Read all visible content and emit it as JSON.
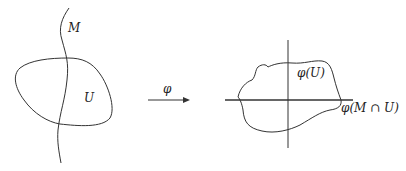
{
  "diagram": {
    "left": {
      "manifold_label": "M",
      "open_set_label": "U"
    },
    "map": {
      "label": "φ"
    },
    "right": {
      "image_label": "φ(U)",
      "intersection_label": "φ(M ∩ U)"
    },
    "colors": {
      "stroke": "#333333",
      "background": "#ffffff"
    }
  }
}
